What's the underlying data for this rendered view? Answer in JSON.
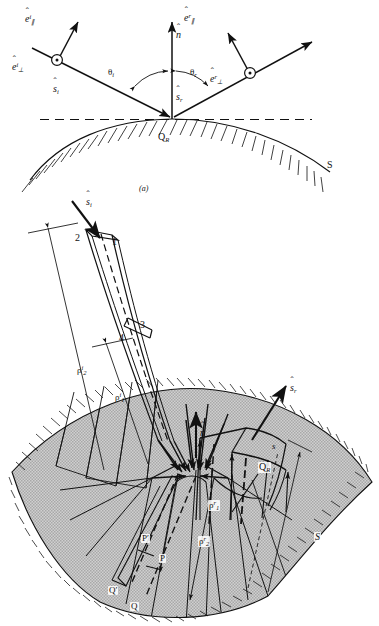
{
  "figure": {
    "panel_a_caption": "(a)",
    "colors": {
      "line": "#111111",
      "surface_fill": "#c9c9c9",
      "background": "#ffffff",
      "dashed": "#111111"
    }
  },
  "panel_a": {
    "name": "incident-and-reflected-ray-geometry",
    "labels": {
      "e_par_inc_base": "e",
      "e_par_inc_sup": "i",
      "e_par_inc_sub": "∥",
      "e_perp_inc_base": "e",
      "e_perp_inc_sup": "i",
      "e_perp_inc_sub": "⊥",
      "e_par_ref_base": "e",
      "e_par_ref_sup": "r",
      "e_par_ref_sub": "∥",
      "e_perp_ref_base": "e",
      "e_perp_ref_sup": "r",
      "e_perp_ref_sub": "⊥",
      "s_inc_base": "s",
      "s_inc_sub": "i",
      "s_ref_base": "s",
      "s_ref_sub": "r",
      "normal_base": "n",
      "theta_i_base": "θ",
      "theta_i_sub": "i",
      "theta_r_base": "θ",
      "theta_r_sub": "r",
      "reflection_point_base": "Q",
      "reflection_point_sub": "R",
      "surface": "S"
    },
    "hat_mark": "ˆ"
  },
  "panel_b": {
    "name": "astigmatic-tube-reflection-detail",
    "labels": {
      "corner_1": "1",
      "corner_2": "2",
      "corner_3": "3",
      "corner_4": "4",
      "s_inc_base": "s",
      "s_inc_sub": "i",
      "s_ref_base": "s",
      "s_ref_sub": "r",
      "normal_base": "n",
      "rho_inc_2_base": "ρ",
      "rho_inc_2_sup": "i",
      "rho_inc_2_sub": "2",
      "rho_inc_1_base": "ρ",
      "rho_inc_1_sup": "i",
      "rho_inc_1_sub": "1",
      "rho_ref_1_base": "ρ",
      "rho_ref_1_sup": "r",
      "rho_ref_1_sub": "1",
      "rho_ref_2_base": "ρ",
      "rho_ref_2_sup": "r",
      "rho_ref_2_sub": "2",
      "distance_s": "s",
      "reflection_point_base": "Q",
      "reflection_point_sub": "R",
      "caustic_P_prime": "P′",
      "caustic_P": "P",
      "caustic_Q_prime": "Q′",
      "caustic_Q": "Q",
      "surface": "S"
    },
    "hat_mark": "ˆ"
  }
}
